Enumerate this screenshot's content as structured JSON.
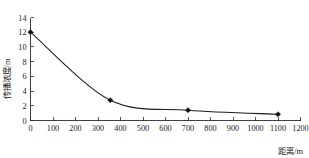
{
  "chart_data": {
    "type": "line",
    "title": "",
    "subtitle": "",
    "xlabel": "距离/m",
    "ylabel": "传播浓度/m",
    "xlim": [
      0,
      1200
    ],
    "ylim": [
      0,
      14
    ],
    "xticks": [
      0,
      100,
      200,
      300,
      400,
      500,
      600,
      700,
      800,
      900,
      1000,
      1100,
      1200
    ],
    "yticks": [
      0,
      2,
      4,
      6,
      8,
      10,
      12,
      14
    ],
    "xtick_labels": [
      "0",
      "100",
      "200",
      "300",
      "400",
      "500",
      "600",
      "700",
      "800",
      "900",
      "1000",
      "1100",
      "1200"
    ],
    "ytick_labels": [
      "0",
      "2",
      "4",
      "6",
      "8",
      "10",
      "12",
      "14"
    ],
    "grid": false,
    "legend": null,
    "legend_position": "none",
    "marker": "filled-diamond",
    "line_color": "#1c1c1c",
    "marker_color": "#121212",
    "series": [
      {
        "name": "传播浓度",
        "x": [
          0,
          355,
          700,
          1100
        ],
        "values": [
          12.0,
          2.75,
          1.4,
          0.85
        ]
      }
    ],
    "annotations": []
  },
  "axes": {
    "x_title": "距离/m",
    "y_title": "传播浓度/m"
  }
}
